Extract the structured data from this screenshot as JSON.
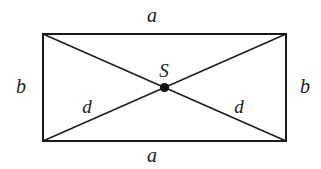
{
  "figure": {
    "kind": "geometry-diagram",
    "background_color": "#ffffff",
    "stroke_color": "#1a1a1a",
    "label_color": "#1a1a1a",
    "rectangle": {
      "left": 42,
      "top": 33,
      "right": 287,
      "bottom": 142,
      "width": 245,
      "height": 109,
      "border_width": 2
    },
    "diagonals": {
      "stroke_width": 1.4,
      "lines": [
        {
          "name": "diagonal-top-left-to-bottom-right",
          "x1": 42,
          "y1": 33,
          "x2": 287,
          "y2": 142
        },
        {
          "name": "diagonal-bottom-left-to-top-right",
          "x1": 42,
          "y1": 142,
          "x2": 287,
          "y2": 33
        }
      ]
    },
    "center_point": {
      "name": "S",
      "x": 164.5,
      "y": 87.5,
      "radius": 4.5,
      "fill": "#111111"
    },
    "labels": {
      "a_top": "a",
      "a_bottom": "a",
      "b_left": "b",
      "b_right": "b",
      "d_left": "d",
      "d_right": "d",
      "s_center": "S"
    }
  }
}
